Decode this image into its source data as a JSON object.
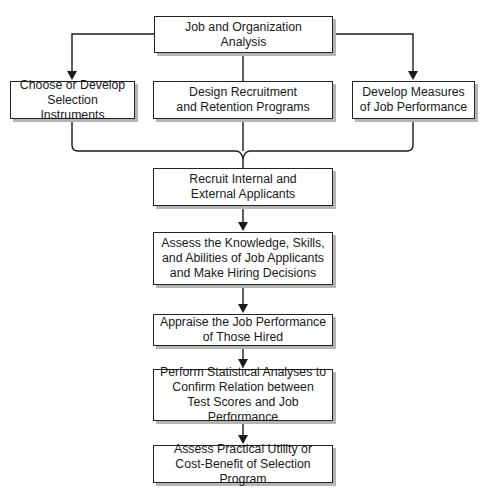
{
  "diagram": {
    "type": "flowchart",
    "nodes": {
      "job_analysis": {
        "lines": [
          "Job and Organization",
          "Analysis"
        ]
      },
      "selection_instruments": {
        "lines": [
          "Choose or Develop",
          "Selection Instruments"
        ]
      },
      "recruitment_programs": {
        "lines": [
          "Design Recruitment",
          "and Retention Programs"
        ]
      },
      "performance_measures": {
        "lines": [
          "Develop Measures",
          "of Job Performance"
        ]
      },
      "recruit_applicants": {
        "lines": [
          "Recruit Internal and",
          "External Applicants"
        ]
      },
      "assess_ksa": {
        "lines": [
          "Assess the Knowledge, Skills,",
          "and Abilities of Job Applicants",
          "and Make Hiring Decisions"
        ]
      },
      "appraise_performance": {
        "lines": [
          "Appraise the Job Performance",
          "of Those Hired"
        ]
      },
      "statistical_analyses": {
        "lines": [
          "Perform Statistical Analyses to",
          "Confirm Relation between",
          "Test Scores and Job Performance"
        ]
      },
      "practical_utility": {
        "lines": [
          "Assess Practical Utility or",
          "Cost-Benefit of Selection Program"
        ]
      }
    },
    "edges": [
      [
        "job_analysis",
        "selection_instruments"
      ],
      [
        "job_analysis",
        "recruitment_programs"
      ],
      [
        "job_analysis",
        "performance_measures"
      ],
      [
        "selection_instruments+recruitment_programs+performance_measures",
        "recruit_applicants"
      ],
      [
        "recruit_applicants",
        "assess_ksa"
      ],
      [
        "assess_ksa",
        "appraise_performance"
      ],
      [
        "appraise_performance",
        "statistical_analyses"
      ],
      [
        "statistical_analyses",
        "practical_utility"
      ]
    ],
    "colors": {
      "line": "#1a1a1a",
      "shadow": "#b5b5b5",
      "box_fill": "#ffffff"
    }
  }
}
